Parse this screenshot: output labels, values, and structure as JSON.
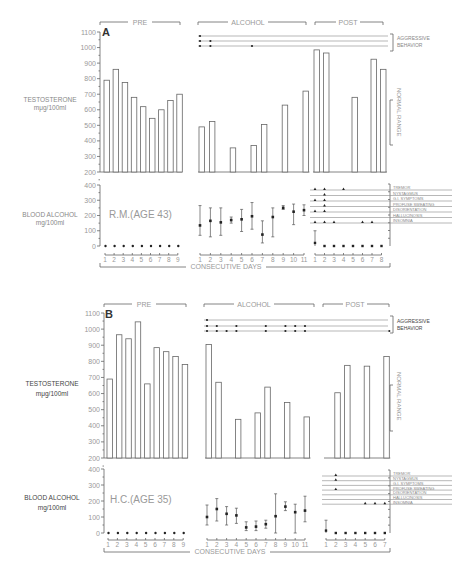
{
  "chart_data": [
    {
      "type": "bar",
      "panel": "A",
      "subject": "R.M.(AGE 43)",
      "phases": [
        "PRE",
        "ALCOHOL",
        "POST"
      ],
      "xlabel": "CONSECUTIVE DAYS",
      "testosterone": {
        "ylabel": "TESTOSTERONE",
        "yunit": "mμg/100ml",
        "ylim": [
          200,
          1100
        ],
        "yticks": [
          200,
          300,
          400,
          500,
          600,
          700,
          800,
          900,
          1000,
          1100
        ],
        "annotation": "NORMAL RANGE",
        "pre": {
          "days": [
            1,
            2,
            3,
            4,
            5,
            6,
            7,
            8,
            9
          ],
          "values": [
            790,
            860,
            775,
            680,
            620,
            545,
            600,
            660,
            700
          ]
        },
        "alcohol": {
          "days": [
            1,
            2,
            3,
            4,
            5,
            6,
            7,
            8,
            9,
            10,
            11
          ],
          "values": [
            490,
            525,
            null,
            355,
            null,
            370,
            505,
            null,
            630,
            null,
            720
          ]
        },
        "post": {
          "days": [
            1,
            2,
            3,
            4,
            5,
            6,
            7,
            8
          ],
          "values": [
            985,
            965,
            null,
            null,
            680,
            null,
            925,
            860
          ]
        }
      },
      "blood_alcohol": {
        "ylabel": "BLOOD ALCOHOL",
        "yunit": "mg/100ml",
        "ylim": [
          0,
          400
        ],
        "yticks": [
          0,
          100,
          200,
          300,
          400
        ],
        "pre": {
          "days": [
            1,
            2,
            3,
            4,
            5,
            6,
            7,
            8,
            9
          ],
          "values": [
            0,
            0,
            0,
            0,
            0,
            0,
            0,
            0,
            0
          ]
        },
        "alcohol": {
          "days": [
            1,
            2,
            3,
            4,
            5,
            6,
            7,
            8,
            9,
            10,
            11
          ],
          "mean": [
            135,
            165,
            155,
            170,
            175,
            195,
            75,
            190,
            250,
            225,
            235
          ],
          "low": [
            70,
            60,
            70,
            150,
            95,
            110,
            20,
            60,
            240,
            140,
            200
          ],
          "high": [
            265,
            250,
            250,
            190,
            240,
            285,
            165,
            250,
            265,
            275,
            270
          ]
        },
        "post": {
          "days": [
            1,
            2,
            3,
            4,
            5,
            6,
            7,
            8
          ],
          "mean": [
            20,
            0,
            0,
            0,
            0,
            0,
            0,
            0
          ],
          "high": [
            100,
            0,
            0,
            0,
            0,
            0,
            0,
            0
          ]
        }
      },
      "aggressive_behavior": {
        "label": "AGGRESSIVE BEHAVIOR",
        "rows": [
          {
            "alcohol_days": [
              1
            ]
          },
          {
            "alcohol_days": [
              1,
              2
            ]
          },
          {
            "alcohol_days": [
              1,
              2,
              6
            ]
          }
        ]
      },
      "withdrawal_symptoms": {
        "labels": [
          "TREMOR",
          "NYSTAGMUS",
          "G.I. SYMPTOMS",
          "PROFUSE SWEATING",
          "DISORIENTATION",
          "HALLUCINOSIS",
          "INSOMNIA"
        ],
        "post_days": {
          "TREMOR": [
            1,
            2,
            4
          ],
          "NYSTAGMUS": [
            2
          ],
          "G.I. SYMPTOMS": [
            1,
            2
          ],
          "PROFUSE SWEATING": [
            2
          ],
          "DISORIENTATION": [
            1,
            2
          ],
          "HALLUCINOSIS": [],
          "INSOMNIA": [
            1,
            2,
            3,
            6,
            7
          ]
        }
      }
    },
    {
      "type": "bar",
      "panel": "B",
      "subject": "H.C.(AGE 35)",
      "phases": [
        "PRE",
        "ALCOHOL",
        "POST"
      ],
      "xlabel": "CONSECUTIVE DAYS",
      "testosterone": {
        "ylabel": "TESTOSTERONE",
        "yunit": "mμg/100ml",
        "ylim": [
          200,
          1100
        ],
        "yticks": [
          200,
          300,
          400,
          500,
          600,
          700,
          800,
          900,
          1000,
          1100
        ],
        "annotation": "NORMAL RANGE",
        "pre": {
          "days": [
            1,
            2,
            3,
            4,
            5,
            6,
            7,
            8,
            9
          ],
          "values": [
            690,
            965,
            940,
            1045,
            660,
            885,
            860,
            830,
            780
          ]
        },
        "alcohol": {
          "days": [
            1,
            2,
            3,
            4,
            5,
            6,
            7,
            8,
            9,
            10,
            11
          ],
          "values": [
            905,
            670,
            null,
            440,
            null,
            480,
            640,
            null,
            545,
            null,
            455
          ]
        },
        "post": {
          "days": [
            1,
            2,
            3,
            4,
            5,
            6,
            7
          ],
          "values": [
            null,
            605,
            775,
            null,
            770,
            null,
            830
          ]
        }
      },
      "blood_alcohol": {
        "ylabel": "BLOOD ALCOHOL",
        "yunit": "mg/100ml",
        "ylim": [
          0,
          400
        ],
        "yticks": [
          0,
          100,
          200,
          300,
          400
        ],
        "pre": {
          "days": [
            1,
            2,
            3,
            4,
            5,
            6,
            7,
            8,
            9
          ],
          "values": [
            0,
            0,
            0,
            0,
            0,
            0,
            0,
            0,
            0
          ]
        },
        "alcohol": {
          "days": [
            1,
            2,
            3,
            4,
            5,
            6,
            7,
            8,
            9,
            10,
            11
          ],
          "mean": [
            100,
            150,
            120,
            110,
            35,
            40,
            55,
            105,
            165,
            130,
            140
          ],
          "low": [
            50,
            75,
            50,
            60,
            15,
            15,
            30,
            0,
            140,
            0,
            70
          ],
          "high": [
            175,
            215,
            165,
            155,
            70,
            75,
            80,
            245,
            195,
            180,
            230
          ]
        },
        "post": {
          "days": [
            1,
            2,
            3,
            4,
            5,
            6,
            7
          ],
          "mean": [
            15,
            0,
            0,
            0,
            0,
            0,
            0
          ],
          "high": [
            80,
            0,
            0,
            0,
            0,
            0,
            0
          ]
        }
      },
      "aggressive_behavior": {
        "label": "AGGRESSIVE BEHAVIOR",
        "rows": [
          {
            "alcohol_days": [
              1
            ]
          },
          {
            "alcohol_days": [
              1,
              2,
              4,
              7,
              9,
              10,
              11
            ]
          },
          {
            "alcohol_days": [
              1,
              2,
              3,
              4,
              7,
              9,
              10,
              11
            ],
            "post_days": [
              7
            ]
          }
        ]
      },
      "withdrawal_symptoms": {
        "labels": [
          "TREMOR",
          "NYSTAGMUS",
          "G.I. SYMPTOMS",
          "PROFUSE SWEATING",
          "DISORIENTATION",
          "HALLUCINOSIS",
          "INSOMNIA"
        ],
        "post_days": {
          "TREMOR": [
            2
          ],
          "NYSTAGMUS": [
            2
          ],
          "G.I. SYMPTOMS": [],
          "PROFUSE SWEATING": [
            2
          ],
          "DISORIENTATION": [],
          "HALLUCINOSIS": [],
          "INSOMNIA": [
            5,
            6,
            7
          ]
        }
      }
    }
  ],
  "panelA": {
    "letter": "A",
    "pre": "PRE",
    "alcohol": "ALCOHOL",
    "post": "POST",
    "testosterone_label": "TESTOSTERONE",
    "testosterone_unit": "mμg/100ml",
    "ba_label": "BLOOD ALCOHOL",
    "ba_unit": "mg/100ml",
    "subject": "R.M.(AGE 43)",
    "aggr1": "AGGRESSIVE",
    "aggr2": "BEHAVIOR",
    "normal_range": "NORMAL RANGE",
    "consecutive_days": "CONSECUTIVE DAYS"
  },
  "panelB": {
    "letter": "B",
    "pre": "PRE",
    "alcohol": "ALCOHOL",
    "post": "POST",
    "testosterone_label": "TESTOSTERONE",
    "testosterone_unit": "mμg/100ml",
    "ba_label": "BLOOD ALCOHOL",
    "ba_unit": "mg/100ml",
    "subject": "H.C.(AGE 35)",
    "aggr1": "AGGRESSIVE",
    "aggr2": "BEHAVIOR",
    "normal_range": "NORMAL RANGE",
    "consecutive_days": "CONSECUTIVE DAYS"
  },
  "symptoms": [
    "TREMOR",
    "NYSTAGMUS",
    "G.I. SYMPTOMS",
    "PROFUSE SWEATING",
    "DISORIENTATION",
    "HALLUCINOSIS",
    "INSOMNIA"
  ]
}
